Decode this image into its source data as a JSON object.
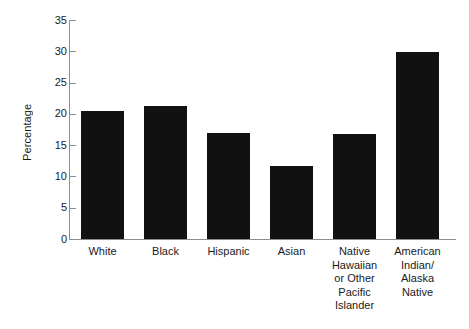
{
  "chart_data": {
    "type": "bar",
    "title": "",
    "subtitle": "",
    "xlabel": "",
    "ylabel": "Percentage",
    "categories": [
      "White",
      "Black",
      "Hispanic",
      "Asian",
      "Native Hawaiian or Other Pacific Islander",
      "American Indian/ Alaska Native"
    ],
    "category_lines": [
      [
        "White"
      ],
      [
        "Black"
      ],
      [
        "Hispanic"
      ],
      [
        "Asian"
      ],
      [
        "Native",
        "Hawaiian",
        "or Other",
        "Pacific",
        "Islander"
      ],
      [
        "American",
        "Indian/",
        "Alaska",
        "Native"
      ]
    ],
    "values": [
      20.5,
      21.2,
      17.0,
      11.6,
      16.8,
      29.9
    ],
    "ylim": [
      0,
      35
    ],
    "ytick_values": [
      0,
      5,
      10,
      15,
      20,
      25,
      30,
      35
    ],
    "ytick_labels": [
      "0",
      "5",
      "10",
      "15",
      "20",
      "25",
      "30",
      "35"
    ],
    "grid": false,
    "legend": null,
    "bar_color": "#111111",
    "axis_color": "#8d8d8d",
    "text_color": "#1a1a1a",
    "background": "#ffffff"
  },
  "axis": {
    "y_title": "Percentage"
  }
}
